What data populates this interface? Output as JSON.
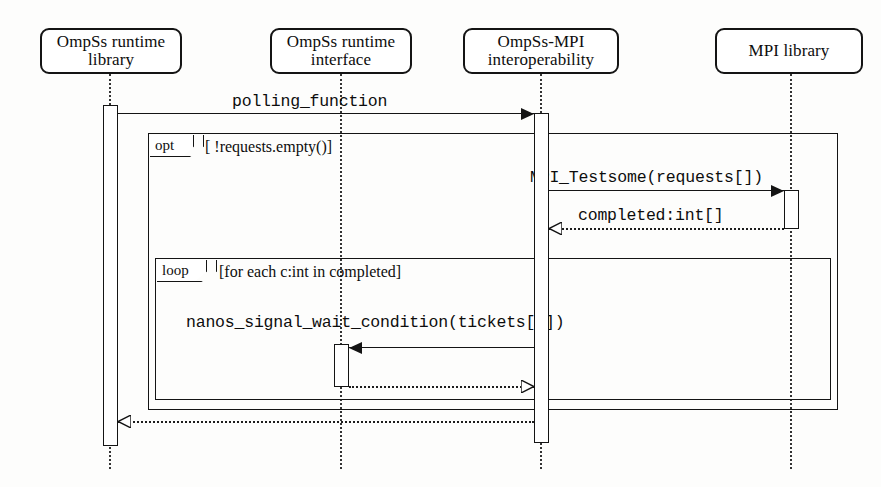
{
  "diagram": {
    "type": "uml-sequence-diagram",
    "width": 881,
    "height": 487,
    "background_color": "#fdfdfc",
    "line_color": "#141414"
  },
  "lifelines": [
    {
      "id": "ompss-runtime-library",
      "name_line1": "OmpSs runtime",
      "name_line2": "library",
      "x": 110,
      "box": {
        "left": 40,
        "top": 28,
        "width": 142,
        "height": 46
      }
    },
    {
      "id": "ompss-runtime-interface",
      "name_line1": "OmpSs runtime",
      "name_line2": "interface",
      "x": 341,
      "box": {
        "left": 270,
        "top": 28,
        "width": 142,
        "height": 46
      }
    },
    {
      "id": "ompss-mpi-interoperability",
      "name_line1": "OmpSs-MPI",
      "name_line2": "interoperability",
      "x": 541,
      "box": {
        "left": 463,
        "top": 28,
        "width": 156,
        "height": 46
      }
    },
    {
      "id": "mpi-library",
      "name_line1": "MPI library",
      "name_line2": "",
      "x": 791,
      "box": {
        "left": 715,
        "top": 28,
        "width": 148,
        "height": 46
      }
    }
  ],
  "activations": [
    {
      "id": "activation-ompss-runtime-library",
      "lifeline": "ompss-runtime-library",
      "left": 103,
      "top": 105,
      "width": 15,
      "height": 341
    },
    {
      "id": "activation-ompss-mpi-interop",
      "lifeline": "ompss-mpi-interoperability",
      "left": 534,
      "top": 113,
      "width": 15,
      "height": 330
    },
    {
      "id": "activation-mpi-library",
      "lifeline": "mpi-library",
      "left": 784,
      "top": 190,
      "width": 15,
      "height": 39
    },
    {
      "id": "activation-ompss-runtime-interface",
      "lifeline": "ompss-runtime-interface",
      "left": 334,
      "top": 344,
      "width": 15,
      "height": 43
    }
  ],
  "fragments": [
    {
      "id": "opt-fragment",
      "operator": "opt",
      "guard": "[ !requests.empty()]",
      "tag_width": 44,
      "guard_left": 205,
      "box": {
        "left": 148,
        "top": 133,
        "width": 690,
        "height": 277
      }
    },
    {
      "id": "loop-fragment",
      "operator": "loop",
      "guard": "[for each c:int in completed]",
      "tag_width": 50,
      "guard_left": 219,
      "box": {
        "left": 155,
        "top": 258,
        "width": 676,
        "height": 142
      }
    }
  ],
  "messages": [
    {
      "id": "msg-polling-function",
      "label": "polling_function",
      "kind": "call",
      "style": "solid",
      "arrowhead": "filled",
      "direction": "right",
      "from": "ompss-runtime-library",
      "to": "ompss-mpi-interoperability",
      "line": {
        "left": 118,
        "top": 113,
        "width": 416
      },
      "label_left": 232,
      "label_top": 92
    },
    {
      "id": "msg-mpi-testsome",
      "label": "MPI_Testsome(requests[])",
      "kind": "call",
      "style": "solid",
      "arrowhead": "filled",
      "direction": "right",
      "from": "ompss-mpi-interoperability",
      "to": "mpi-library",
      "line": {
        "left": 549,
        "top": 190,
        "width": 235
      },
      "label_left": 530,
      "label_top": 168
    },
    {
      "id": "msg-completed-return",
      "label": "completed:int[]",
      "kind": "return",
      "style": "dotted",
      "arrowhead": "open",
      "direction": "left",
      "from": "mpi-library",
      "to": "ompss-mpi-interoperability",
      "line": {
        "left": 549,
        "top": 228,
        "width": 235
      },
      "label_left": 578,
      "label_top": 206
    },
    {
      "id": "msg-nanos-signal-wait-condition",
      "label": "nanos_signal_wait_condition(tickets[c])",
      "kind": "call",
      "style": "solid",
      "arrowhead": "filled",
      "direction": "left",
      "from": "ompss-mpi-interoperability",
      "to": "ompss-runtime-interface",
      "line": {
        "left": 349,
        "top": 347,
        "width": 185
      },
      "label_left": 186,
      "label_top": 313
    },
    {
      "id": "msg-nanos-return",
      "label": "",
      "kind": "return",
      "style": "dotted",
      "arrowhead": "open",
      "direction": "right",
      "from": "ompss-runtime-interface",
      "to": "ompss-mpi-interoperability",
      "line": {
        "left": 349,
        "top": 386,
        "width": 185
      },
      "label_left": 0,
      "label_top": 0
    },
    {
      "id": "msg-polling-function-return",
      "label": "",
      "kind": "return",
      "style": "dotted",
      "arrowhead": "open",
      "direction": "left",
      "from": "ompss-mpi-interoperability",
      "to": "ompss-runtime-library",
      "line": {
        "left": 118,
        "top": 421,
        "width": 416
      },
      "label_left": 0,
      "label_top": 0
    }
  ]
}
